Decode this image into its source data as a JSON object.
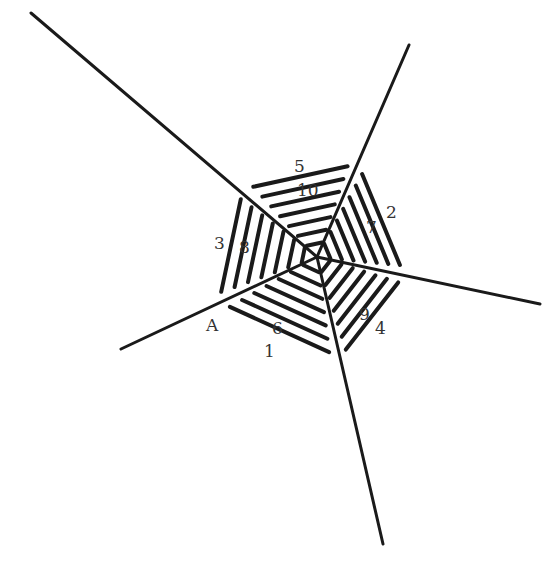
{
  "diagram": {
    "type": "pentagonal-web",
    "center": [
      317,
      257
    ],
    "rays": [
      {
        "name": "upper-left",
        "end": [
          31,
          13
        ]
      },
      {
        "name": "upper-right",
        "end": [
          409,
          45
        ]
      },
      {
        "name": "right",
        "end": [
          540,
          304
        ]
      },
      {
        "name": "bottom",
        "end": [
          383,
          544
        ]
      },
      {
        "name": "lower-left",
        "end": [
          121,
          349
        ]
      }
    ],
    "outer_vertices": [
      [
        243,
        189
      ],
      [
        358,
        164
      ],
      [
        404,
        275
      ],
      [
        340,
        357
      ],
      [
        219,
        302
      ]
    ],
    "ring_scales": [
      1.0,
      0.86,
      0.72,
      0.58,
      0.44,
      0.3,
      0.16
    ],
    "labels": [
      {
        "text": "5",
        "x": 294,
        "y": 172
      },
      {
        "text": "10",
        "x": 297,
        "y": 196
      },
      {
        "text": "2",
        "x": 386,
        "y": 218
      },
      {
        "text": "7",
        "x": 366,
        "y": 233
      },
      {
        "text": "3",
        "x": 214,
        "y": 249
      },
      {
        "text": "8",
        "x": 239,
        "y": 253
      },
      {
        "text": "A",
        "x": 206,
        "y": 331
      },
      {
        "text": "6",
        "x": 272,
        "y": 334
      },
      {
        "text": "1",
        "x": 264,
        "y": 357
      },
      {
        "text": "9",
        "x": 359,
        "y": 320
      },
      {
        "text": "4",
        "x": 375,
        "y": 334
      }
    ],
    "colors": {
      "stroke": "#1a1a1a",
      "label": "#333333",
      "background": "#ffffff"
    }
  }
}
